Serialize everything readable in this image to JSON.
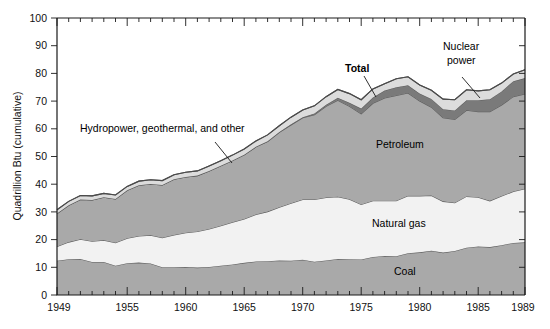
{
  "chart_data": {
    "type": "area",
    "stacked": true,
    "title": "",
    "xlabel": "",
    "ylabel": "Quadrillion Btu (cumulative)",
    "xlim": [
      1949,
      1989
    ],
    "ylim": [
      0,
      100
    ],
    "ytick_labels": [
      "0",
      "10",
      "20",
      "30",
      "40",
      "50",
      "60",
      "70",
      "80",
      "90",
      "100"
    ],
    "ytick_values": [
      0,
      10,
      20,
      30,
      40,
      50,
      60,
      70,
      80,
      90,
      100
    ],
    "ytick_minor_step": 10,
    "xtick_labels": [
      "1949",
      "1955",
      "1960",
      "1965",
      "1970",
      "1975",
      "1980",
      "1985",
      "1989"
    ],
    "xtick_values": [
      1949,
      1955,
      1960,
      1965,
      1970,
      1975,
      1980,
      1985,
      1989
    ],
    "xtick_minor_step": 1,
    "grid": false,
    "legend": "inline-annotations",
    "x": [
      1949,
      1950,
      1951,
      1952,
      1953,
      1954,
      1955,
      1956,
      1957,
      1958,
      1959,
      1960,
      1961,
      1962,
      1963,
      1964,
      1965,
      1966,
      1967,
      1968,
      1969,
      1970,
      1971,
      1972,
      1973,
      1974,
      1975,
      1976,
      1977,
      1978,
      1979,
      1980,
      1981,
      1982,
      1983,
      1984,
      1985,
      1986,
      1987,
      1988,
      1989
    ],
    "series": [
      {
        "name": "Coal",
        "color": "#a9a9a9",
        "values": [
          12.4,
          12.9,
          13.0,
          11.9,
          11.9,
          10.6,
          11.5,
          11.7,
          11.4,
          10.0,
          10.0,
          10.1,
          9.9,
          10.1,
          10.6,
          11.0,
          11.6,
          12.1,
          12.2,
          12.5,
          12.4,
          12.7,
          12.0,
          12.5,
          13.0,
          12.9,
          12.8,
          13.7,
          14.1,
          14.0,
          15.1,
          15.4,
          16.0,
          15.3,
          15.9,
          17.1,
          17.5,
          17.3,
          18.0,
          18.8,
          19.0
        ]
      },
      {
        "name": "Natural gas",
        "color": "#f2f2f2",
        "values": [
          5.1,
          6.2,
          7.1,
          7.5,
          7.9,
          8.3,
          9.0,
          9.6,
          10.2,
          10.7,
          11.7,
          12.4,
          13.0,
          13.7,
          14.4,
          15.3,
          15.8,
          17.0,
          17.9,
          19.2,
          20.7,
          21.8,
          22.5,
          22.7,
          22.5,
          21.7,
          19.9,
          20.3,
          19.9,
          20.0,
          20.7,
          20.4,
          19.9,
          18.5,
          17.4,
          18.5,
          17.8,
          16.7,
          17.7,
          18.6,
          19.4
        ]
      },
      {
        "name": "Petroleum",
        "color": "#a9a9a9",
        "values": [
          11.9,
          13.3,
          14.4,
          14.9,
          15.5,
          15.8,
          17.3,
          18.3,
          18.5,
          19.0,
          20.1,
          20.1,
          20.2,
          21.0,
          21.7,
          22.3,
          23.2,
          24.4,
          25.3,
          27.0,
          28.3,
          29.5,
          30.6,
          32.9,
          34.8,
          33.5,
          32.7,
          35.2,
          37.1,
          38.0,
          37.1,
          34.2,
          31.9,
          30.2,
          30.1,
          31.1,
          30.9,
          32.2,
          32.9,
          34.2,
          34.2
        ]
      },
      {
        "name": "Nuclear power",
        "color": "#7a7a7a",
        "values": [
          0.0,
          0.0,
          0.0,
          0.0,
          0.0,
          0.0,
          0.0,
          0.0,
          0.0,
          0.0,
          0.0,
          0.0,
          0.0,
          0.0,
          0.0,
          0.0,
          0.0,
          0.0,
          0.1,
          0.1,
          0.2,
          0.2,
          0.4,
          0.6,
          0.9,
          1.3,
          1.9,
          2.1,
          2.7,
          3.0,
          2.8,
          2.7,
          3.0,
          3.1,
          3.2,
          3.6,
          4.1,
          4.5,
          4.9,
          5.6,
          5.7
        ]
      },
      {
        "name": "Hydropower, geothermal, and other",
        "color": "#dcdcdc",
        "values": [
          1.4,
          1.4,
          1.4,
          1.5,
          1.4,
          1.4,
          1.4,
          1.5,
          1.5,
          1.6,
          1.6,
          1.7,
          1.7,
          1.8,
          1.8,
          1.9,
          2.1,
          2.1,
          2.3,
          2.3,
          2.6,
          2.6,
          2.8,
          2.9,
          3.0,
          3.3,
          3.2,
          3.1,
          2.5,
          3.1,
          3.1,
          3.1,
          3.1,
          3.6,
          3.9,
          3.8,
          3.4,
          3.4,
          3.0,
          2.6,
          3.0
        ]
      }
    ],
    "total": {
      "name": "Total",
      "values": [
        30.8,
        33.8,
        35.9,
        35.8,
        36.7,
        36.1,
        39.2,
        41.1,
        41.6,
        41.3,
        43.4,
        44.3,
        44.8,
        46.6,
        48.5,
        50.5,
        52.7,
        55.6,
        57.8,
        61.1,
        64.2,
        66.8,
        68.3,
        71.6,
        74.2,
        72.7,
        70.5,
        74.4,
        76.3,
        78.1,
        78.8,
        75.8,
        73.9,
        70.7,
        70.5,
        74.1,
        73.7,
        74.1,
        76.5,
        79.8,
        81.3
      ]
    },
    "annotations": [
      {
        "id": "total-label",
        "text": "Total",
        "bold": true,
        "x_px": 345,
        "y_px": 72,
        "leader": {
          "x1": 364,
          "y1": 76,
          "x2": 376,
          "y2": 97
        }
      },
      {
        "id": "nuclear-label-line1",
        "text": "Nuclear",
        "bold": false,
        "x_px": 443,
        "y_px": 50,
        "leader": {
          "x1": 462,
          "y1": 77,
          "x2": 480,
          "y2": 98
        }
      },
      {
        "id": "nuclear-label-line2",
        "text": "power",
        "bold": false,
        "x_px": 447,
        "y_px": 64,
        "leader": null
      },
      {
        "id": "hydro-label",
        "text": "Hydropower, geothermal, and other",
        "bold": false,
        "x_px": 80,
        "y_px": 132,
        "leader": {
          "x1": 215,
          "y1": 142,
          "x2": 232,
          "y2": 163
        }
      },
      {
        "id": "petroleum-label",
        "text": "Petroleum",
        "bold": false,
        "x_px": 376,
        "y_px": 148,
        "leader": null
      },
      {
        "id": "natural-gas-label",
        "text": "Natural gas",
        "bold": false,
        "x_px": 372,
        "y_px": 227,
        "leader": null
      },
      {
        "id": "coal-label",
        "text": "Coal",
        "bold": false,
        "x_px": 394,
        "y_px": 275,
        "leader": null
      }
    ],
    "colors": {
      "coal": "#a9a9a9",
      "natural_gas": "#f2f2f2",
      "petroleum": "#a9a9a9",
      "nuclear": "#7a7a7a",
      "hydro_other": "#dcdcdc",
      "axis": "#1a1a1a",
      "band_edge": "#5d5d5d",
      "background": "#ffffff"
    }
  }
}
